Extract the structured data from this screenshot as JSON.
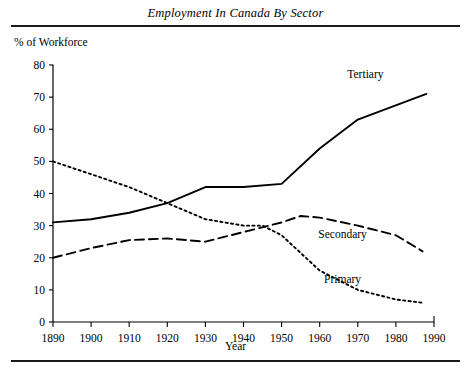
{
  "chart_data": {
    "type": "line",
    "title": "Employment In Canada By Sector",
    "xlabel": "Year",
    "ylabel": "% of Workforce",
    "xlim": [
      1890,
      1990
    ],
    "ylim": [
      0,
      80
    ],
    "xticks": [
      1890,
      1900,
      1910,
      1920,
      1930,
      1940,
      1950,
      1960,
      1970,
      1980,
      1990
    ],
    "yticks": [
      0,
      10,
      20,
      30,
      40,
      50,
      60,
      70,
      80
    ],
    "grid": false,
    "legend_position": "inline-right",
    "series": [
      {
        "name": "Tertiary",
        "style": "solid",
        "color": "#000000",
        "label_x": 1972,
        "label_y": 76,
        "x": [
          1890,
          1900,
          1910,
          1920,
          1930,
          1940,
          1950,
          1960,
          1970,
          1988
        ],
        "values": [
          31,
          32,
          34,
          37,
          42,
          42,
          43,
          54,
          63,
          71
        ]
      },
      {
        "name": "Secondary",
        "style": "dashed",
        "color": "#000000",
        "label_x": 1966,
        "label_y": 26,
        "x": [
          1890,
          1900,
          1910,
          1920,
          1930,
          1940,
          1950,
          1955,
          1960,
          1970,
          1980,
          1987
        ],
        "values": [
          20,
          23,
          25.5,
          26,
          25,
          28,
          31,
          33,
          32.5,
          30,
          27,
          22
        ]
      },
      {
        "name": "Primary",
        "style": "dotted",
        "color": "#000000",
        "label_x": 1966,
        "label_y": 12,
        "x": [
          1890,
          1900,
          1910,
          1920,
          1930,
          1940,
          1945,
          1950,
          1960,
          1970,
          1980,
          1987
        ],
        "values": [
          50,
          46,
          42,
          37,
          32,
          30,
          30,
          27,
          16,
          10,
          7,
          6
        ]
      }
    ]
  },
  "axis": {
    "ylabel_text": "% of Workforce",
    "xlabel_text": "Year"
  }
}
